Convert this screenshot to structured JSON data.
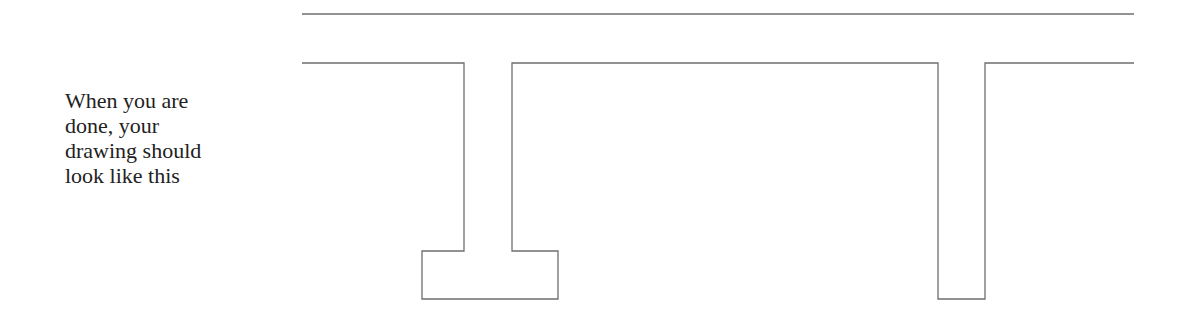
{
  "caption": {
    "lines": [
      "When you are",
      "done, your",
      "drawing should",
      "look like this"
    ]
  },
  "drawing": {
    "stroke_color": "#6e6e6e",
    "top_line": {
      "x1": 302,
      "y1": 14,
      "x2": 1134,
      "y2": 14
    },
    "profile_path": "M302 63 L464 63 L464 251 L422 251 L422 299 L558 299 L558 251 L512 251 L512 63 L938 63 L938 299 L985 299 L985 63 L1134 63"
  }
}
